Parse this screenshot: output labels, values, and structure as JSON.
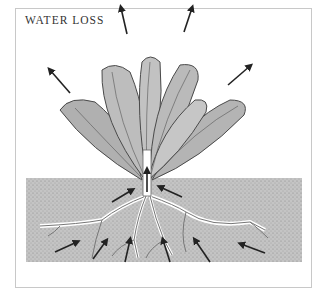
{
  "title": "WATER LOSS",
  "colors": {
    "soil": "#bdbdbd",
    "leaf": "#b5b5b5",
    "leaf_stroke": "#555555",
    "arrow": "#222222",
    "frame": "#c8c8c8",
    "root": "#ffffff"
  },
  "diagram": {
    "elements": [
      "plant leaves",
      "stem",
      "roots",
      "soil",
      "water-uptake arrows",
      "water-loss arrows"
    ],
    "arrows": {
      "leaf_outflow": 5,
      "stem_upflow": 1,
      "root_inflow": 9
    }
  }
}
